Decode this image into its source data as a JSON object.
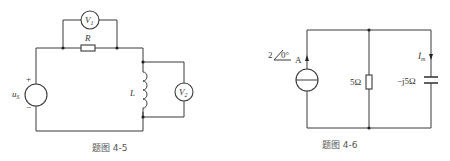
{
  "figures": [
    {
      "id": "fig-4-5",
      "caption": "题图 4-5",
      "components": {
        "source": {
          "label": "u",
          "subscript": "S",
          "plus": "+",
          "minus": "−"
        },
        "resistor": {
          "label": "R"
        },
        "inductor": {
          "label": "L"
        },
        "voltmeter1": {
          "label": "V",
          "subscript": "1"
        },
        "voltmeter2": {
          "label": "V",
          "subscript": "2"
        }
      }
    },
    {
      "id": "fig-4-6",
      "caption": "题图 4-6",
      "components": {
        "current_source": {
          "magnitude": "2",
          "angle": "0°",
          "unit": "A"
        },
        "resistor": {
          "label": "5Ω"
        },
        "capacitor": {
          "label": "−j5Ω"
        },
        "current": {
          "label": "İ",
          "subscript": "m"
        }
      }
    }
  ],
  "colors": {
    "line": "#3a3a3a",
    "text": "#333333",
    "caption": "#555555"
  }
}
